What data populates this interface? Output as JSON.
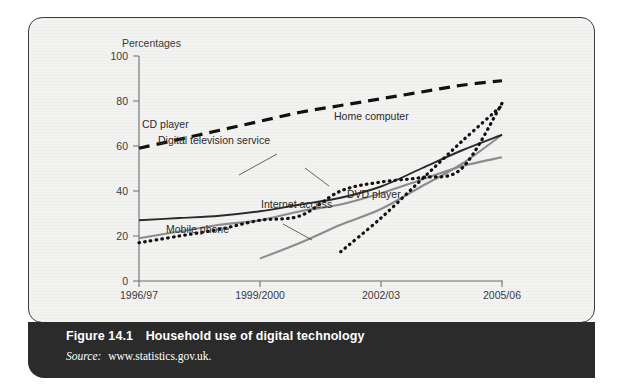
{
  "figure": {
    "number_label": "Figure 14.1",
    "title": "Household use of digital technology",
    "source_label": "Source:",
    "source_value": "www.statistics.gov.uk."
  },
  "chart_data": {
    "type": "line",
    "title": "Household use of digital technology",
    "xlabel": "",
    "ylabel": "Percentages",
    "ylim": [
      0,
      100
    ],
    "yticks": [
      0,
      20,
      40,
      60,
      80,
      100
    ],
    "grid": false,
    "legend_position": "inline-annotations",
    "categories": [
      "1996/97",
      "1997/98",
      "1998/99",
      "1999/2000",
      "2000/01",
      "2001/02",
      "2002/03",
      "2003/04",
      "2004/05",
      "2005/06"
    ],
    "xticks": [
      "1996/97",
      "1999/2000",
      "2002/03",
      "2005/06"
    ],
    "series": [
      {
        "name": "CD player",
        "style": "dashed",
        "color": "#111111",
        "values": [
          59,
          63,
          67,
          71,
          75,
          78,
          81,
          84,
          87,
          89
        ]
      },
      {
        "name": "Digital television service",
        "style": "dotted",
        "color": "#111111",
        "values": [
          17,
          20,
          23,
          27,
          29,
          40,
          44,
          46,
          50,
          79
        ]
      },
      {
        "name": "Home computer",
        "style": "solid",
        "color": "#2a2a2a",
        "values": [
          27,
          28,
          29,
          31,
          34,
          37,
          42,
          50,
          58,
          65
        ]
      },
      {
        "name": "Internet access",
        "style": "solid",
        "color": "#8c8c8c",
        "values": [
          19,
          22,
          25,
          27,
          31,
          34,
          39,
          45,
          51,
          55
        ]
      },
      {
        "name": "Mobile phone",
        "style": "solid",
        "color": "#8c8c8c",
        "values": [
          null,
          null,
          null,
          10,
          17,
          25,
          32,
          42,
          52,
          65
        ]
      },
      {
        "name": "DVD player",
        "style": "dotted",
        "color": "#111111",
        "values": [
          null,
          null,
          null,
          null,
          null,
          13,
          28,
          45,
          62,
          78
        ]
      }
    ],
    "annotations": [
      {
        "text": "CD player",
        "x": 140,
        "y": 145
      },
      {
        "text": "Digital television service",
        "x": 156,
        "y": 160
      },
      {
        "text": "Home computer",
        "x": 368,
        "y": 130
      },
      {
        "text": "Internet access",
        "x": 286,
        "y": 222
      },
      {
        "text": "Mobile phone",
        "x": 164,
        "y": 246
      },
      {
        "text": "DVD player",
        "x": 381,
        "y": 208
      }
    ]
  }
}
